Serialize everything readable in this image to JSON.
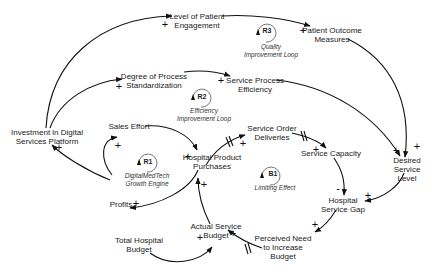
{
  "diagram": {
    "type": "causal-loop-diagram",
    "nodes": {
      "investment": "Investment in Digital\nServices Platform",
      "engagement": "Level of Patient\nEngagement",
      "outcome": "Patient Outcome\nMeasures",
      "standardization": "Degree of Process\nStandardization",
      "efficiency": "Service Process\nEfficiency",
      "sales": "Sales Effort",
      "purchases": "Hospital Product\nPurchases",
      "profits": "Profits",
      "deliveries": "Service Order\nDeliveries",
      "capacity": "Service Capacity",
      "desired": "Desired\nService Level",
      "gap": "Hospital\nService Gap",
      "need": "Perceived Need\nto Increase\nBudget",
      "actual_budget": "Actual Service\nBudget",
      "total_budget": "Total Hospital\nBudget"
    },
    "loops": {
      "r1": {
        "id": "R1",
        "label": "DigitalMedTech\nGrowth Engine"
      },
      "r2": {
        "id": "R2",
        "label": "Efficiency\nImprovement Loop"
      },
      "r3": {
        "id": "R3",
        "label": "Quality\nImprovement Loop"
      },
      "b1": {
        "id": "B1",
        "label": "Limiting Effect"
      }
    },
    "links": [
      {
        "from": "Investment in Digital Services Platform",
        "to": "Level of Patient Engagement",
        "polarity": "+"
      },
      {
        "from": "Investment in Digital Services Platform",
        "to": "Degree of Process Standardization",
        "polarity": "+"
      },
      {
        "from": "Level of Patient Engagement",
        "to": "Patient Outcome Measures",
        "polarity": "+"
      },
      {
        "from": "Degree of Process Standardization",
        "to": "Service Process Efficiency",
        "polarity": "+"
      },
      {
        "from": "Patient Outcome Measures",
        "to": "Desired Service Level",
        "polarity": "+"
      },
      {
        "from": "Service Process Efficiency",
        "to": "Desired Service Level",
        "polarity": "+"
      },
      {
        "from": "Profits",
        "to": "Investment in Digital Services Platform",
        "polarity": "+"
      },
      {
        "from": "Profits",
        "to": "Sales Effort",
        "polarity": "+"
      },
      {
        "from": "Sales Effort",
        "to": "Hospital Product Purchases",
        "polarity": "+"
      },
      {
        "from": "Hospital Product Purchases",
        "to": "Profits",
        "polarity": "+"
      },
      {
        "from": "Hospital Product Purchases",
        "to": "Service Order Deliveries",
        "polarity": "+",
        "delay": true
      },
      {
        "from": "Service Order Deliveries",
        "to": "Service Capacity",
        "polarity": "+",
        "delay": true
      },
      {
        "from": "Service Capacity",
        "to": "Hospital Service Gap",
        "polarity": "-"
      },
      {
        "from": "Desired Service Level",
        "to": "Hospital Service Gap",
        "polarity": "+"
      },
      {
        "from": "Hospital Service Gap",
        "to": "Perceived Need to Increase Budget",
        "polarity": "+"
      },
      {
        "from": "Perceived Need to Increase Budget",
        "to": "Actual Service Budget",
        "polarity": "+",
        "delay": true
      },
      {
        "from": "Total Hospital Budget",
        "to": "Actual Service Budget",
        "polarity": "+"
      },
      {
        "from": "Actual Service Budget",
        "to": "Hospital Product Purchases",
        "polarity": "+"
      }
    ],
    "polarity_plus": "+",
    "polarity_minus": "-"
  }
}
